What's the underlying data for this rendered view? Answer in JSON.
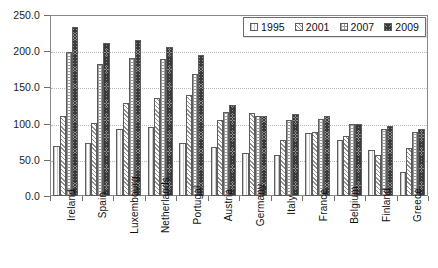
{
  "chart_data": {
    "type": "bar",
    "title": "",
    "subtitle": "",
    "xlabel": "",
    "ylabel": "",
    "ylim": [
      0,
      250
    ],
    "ytick_labels": [
      "0.0",
      "50.0",
      "100.0",
      "150.0",
      "200.0",
      "250.0"
    ],
    "ytick_values": [
      0,
      50,
      100,
      150,
      200,
      250
    ],
    "grid": true,
    "legend_position": "top-right",
    "categories": [
      "Ireland",
      "Spain",
      "Luxembourg",
      "Netherlands",
      "Portugal",
      "Austria",
      "Germany",
      "Italy",
      "France",
      "Belgium",
      "Finland",
      "Greece"
    ],
    "series": [
      {
        "name": "1995",
        "pattern": "open-light",
        "values": [
          69,
          73,
          93,
          95,
          73,
          68,
          60,
          56,
          87,
          78,
          64,
          33
        ]
      },
      {
        "name": "2001",
        "pattern": "diagonal-hatch",
        "values": [
          110,
          101,
          129,
          135,
          140,
          105,
          115,
          78,
          89,
          83,
          57,
          66
        ]
      },
      {
        "name": "2007",
        "pattern": "dotted-grid",
        "values": [
          199,
          183,
          191,
          189,
          169,
          116,
          111,
          105,
          107,
          99,
          92,
          89
        ]
      },
      {
        "name": "2009",
        "pattern": "dark-crosshatch",
        "values": [
          234,
          211,
          215,
          206,
          195,
          126,
          110,
          113,
          110,
          99,
          97,
          92
        ]
      }
    ]
  },
  "legend": {
    "entries": [
      {
        "label": "1995"
      },
      {
        "label": "2001"
      },
      {
        "label": "2007"
      },
      {
        "label": "2009"
      }
    ]
  }
}
